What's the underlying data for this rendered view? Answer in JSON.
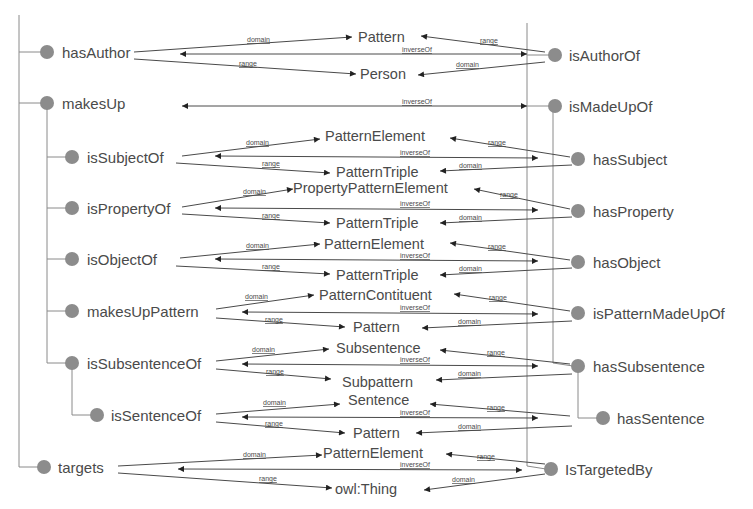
{
  "diagram": {
    "edge_labels": {
      "domain": "domain",
      "range": "range",
      "inverse": "inverseOf"
    },
    "left_properties": {
      "hasAuthor": "hasAuthor",
      "makesUp": "makesUp",
      "isSubjectOf": "isSubjectOf",
      "isPropertyOf": "isPropertyOf",
      "isObjectOf": "isObjectOf",
      "makesUpPattern": "makesUpPattern",
      "isSubsentenceOf": "isSubsentenceOf",
      "isSentenceOf": "isSentenceOf",
      "targets": "targets"
    },
    "right_properties": {
      "isAuthorOf": "isAuthorOf",
      "isMadeUpOf": "isMadeUpOf",
      "hasSubject": "hasSubject",
      "hasProperty": "hasProperty",
      "hasObject": "hasObject",
      "isPatternMadeUpOf": "isPatternMadeUpOf",
      "hasSubsentence": "hasSubsentence",
      "hasSentence": "hasSentence",
      "isTargetedBy": "IsTargetedBy"
    },
    "classes": {
      "r1_domain": "Pattern",
      "r1_range": "Person",
      "r3_domain": "PatternElement",
      "r3_range": "PatternTriple",
      "r4_domain": "PropertyPatternElement",
      "r4_range": "PatternTriple",
      "r5_domain": "PatternElement",
      "r5_range": "PatternTriple",
      "r6_domain": "PatternContituent",
      "r6_range": "Pattern",
      "r7_domain": "Subsentence",
      "r7_range": "Subpattern",
      "r8_domain": "Sentence",
      "r8_range": "Pattern",
      "r9_domain": "PatternElement",
      "r9_range": "owl:Thing"
    },
    "relations": [
      {
        "left": "hasAuthor",
        "right": "isAuthorOf",
        "domain": "Pattern",
        "range": "Person"
      },
      {
        "left": "makesUp",
        "right": "isMadeUpOf",
        "domain": null,
        "range": null
      },
      {
        "left": "isSubjectOf",
        "right": "hasSubject",
        "domain": "PatternElement",
        "range": "PatternTriple"
      },
      {
        "left": "isPropertyOf",
        "right": "hasProperty",
        "domain": "PropertyPatternElement",
        "range": "PatternTriple"
      },
      {
        "left": "isObjectOf",
        "right": "hasObject",
        "domain": "PatternElement",
        "range": "PatternTriple"
      },
      {
        "left": "makesUpPattern",
        "right": "isPatternMadeUpOf",
        "domain": "PatternContituent",
        "range": "Pattern"
      },
      {
        "left": "isSubsentenceOf",
        "right": "hasSubsentence",
        "domain": "Subsentence",
        "range": "Subpattern"
      },
      {
        "left": "isSentenceOf",
        "right": "hasSentence",
        "domain": "Sentence",
        "range": "Pattern"
      },
      {
        "left": "targets",
        "right": "IsTargetedBy",
        "domain": "PatternElement",
        "range": "owl:Thing"
      }
    ],
    "colors": {
      "node": "#8c8c8c",
      "text": "#4a4a4a",
      "tree_line": "#8a8a8a",
      "background": "#ffffff"
    }
  }
}
